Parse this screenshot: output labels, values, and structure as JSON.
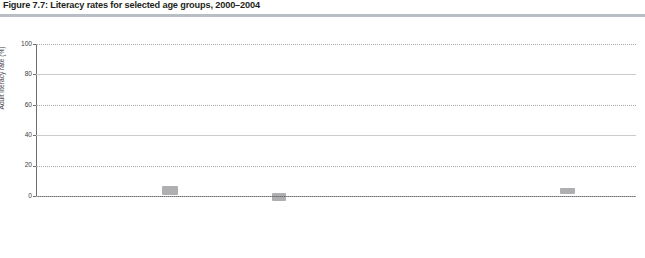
{
  "figure": {
    "title": "Figure 7.7: Literacy rates for selected age groups, 2000–2004"
  },
  "axes": {
    "ylabel": "Adult literacy rate (%)",
    "yticks": [
      "0",
      "20",
      "40",
      "60",
      "80",
      "100"
    ]
  },
  "legend": {
    "items": [
      {
        "label": "15–24",
        "marker": "triangle-marker",
        "color": "#58595b"
      },
      {
        "label": "25–34",
        "marker": "bar-marker",
        "color": "#808285"
      },
      {
        "label": "45–54",
        "marker": "diamond-marker",
        "color": "#bcbec0"
      },
      {
        "label": "55–64",
        "marker": "cross-marker",
        "color": "#a7a9ac"
      }
    ]
  },
  "groups": [
    {
      "name": "Arab States"
    },
    {
      "name": "Asia"
    },
    {
      "name": "Latin America and the Caribbean"
    }
  ],
  "chart_data": {
    "type": "scatter",
    "title": "Figure 7.7: Literacy rates for selected age groups, 2000–2004",
    "xlabel": "",
    "ylabel": "Adult literacy rate (%)",
    "ylim": [
      0,
      100
    ],
    "grid": true,
    "legend_position": "bottom-right",
    "series_names": [
      "15–24",
      "25–34",
      "45–54",
      "55–64"
    ],
    "groups": [
      {
        "name": "Arab States",
        "categories": [
          "Jordan",
          "Qatar",
          "Bahrain",
          "Syrian AR",
          "Saudi Arabia",
          "Tunisia",
          "Algeria",
          "Sudan",
          "Egypt",
          "Mauritania"
        ],
        "series": [
          {
            "name": "15–24",
            "values": [
              99,
              97,
              97,
              92,
              92,
              92,
              89,
              77,
              75,
              61
            ]
          },
          {
            "name": "25–34",
            "values": [
              98,
              97,
              96,
              88,
              87,
              87,
              83,
              64,
              60,
              55
            ]
          },
          {
            "name": "45–54",
            "values": [
              81,
              80,
              80,
              67,
              58,
              67,
              48,
              40,
              40,
              38
            ]
          },
          {
            "name": "55–64",
            "values": [
              63,
              45,
              44,
              42,
              40,
              39,
              27,
              36,
              31,
              36
            ]
          }
        ]
      },
      {
        "name": "Asia",
        "categories": [
          "Maldives",
          "Philippines",
          "Thailand",
          "Singapore",
          "China",
          "Sri Lanka",
          "Myanmar",
          "Turkey",
          "Cambodia",
          "Lao PDR",
          "India",
          "Papua N. Guinea",
          "Pakistan",
          "Nepal"
        ],
        "series": [
          {
            "name": "15–24",
            "values": [
              98,
              96,
              98,
              100,
              99,
              96,
              95,
              96,
              83,
              79,
              76,
              68,
              65,
              70
            ]
          },
          {
            "name": "25–34",
            "values": [
              98,
              96,
              98,
              99,
              98,
              95,
              93,
              94,
              77,
              72,
              68,
              62,
              55,
              57
            ]
          },
          {
            "name": "45–54",
            "values": [
              96,
              94,
              94,
              92,
              91,
              93,
              92,
              84,
              74,
              62,
              52,
              46,
              42,
              36
            ]
          },
          {
            "name": "55–64",
            "values": [
              95,
              92,
              89,
              88,
              85,
              91,
              90,
              73,
              62,
              50,
              41,
              37,
              31,
              20
            ]
          }
        ]
      },
      {
        "name": "Latin America and the Caribbean",
        "categories": [
          "Cuba",
          "Argentina",
          "Chile",
          "Colombia",
          "Venezuela",
          "Panama",
          "Paraguay",
          "Ecuador",
          "Mexico",
          "Saint Lucia",
          "Brazil",
          "Suriname",
          "Dominican Rep.",
          "Peru",
          "Bolivia",
          "Honduras",
          "Belize",
          "Nicaragua",
          "Guatemala"
        ],
        "series": [
          {
            "name": "15–24",
            "values": [
              100,
              99,
              99,
              98,
              98,
              97,
              97,
              97,
              97,
              96,
              97,
              96,
              95,
              97,
              98,
              93,
              92,
              87,
              82
            ]
          },
          {
            "name": "25–34",
            "values": [
              100,
              99,
              99,
              96,
              96,
              96,
              96,
              96,
              96,
              94,
              95,
              95,
              93,
              95,
              96,
              88,
              90,
              81,
              74
            ]
          },
          {
            "name": "45–54",
            "values": [
              99,
              97,
              97,
              92,
              91,
              91,
              90,
              90,
              89,
              88,
              88,
              90,
              86,
              86,
              85,
              79,
              78,
              69,
              64
            ]
          },
          {
            "name": "55–64",
            "values": [
              98,
              96,
              96,
              88,
              86,
              87,
              86,
              86,
              83,
              82,
              81,
              84,
              81,
              76,
              77,
              73,
              76,
              61,
              54
            ]
          }
        ]
      }
    ]
  }
}
